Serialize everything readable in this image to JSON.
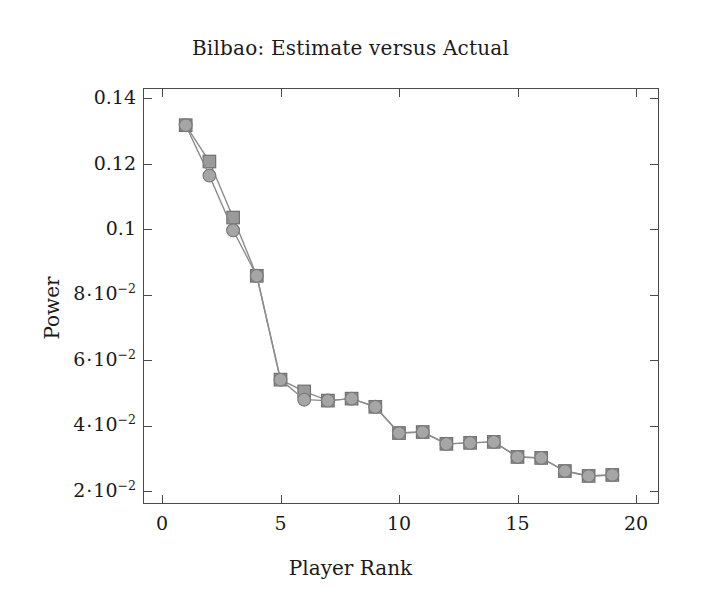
{
  "chart_data": {
    "type": "line",
    "title": "Bilbao: Estimate versus Actual",
    "xlabel": "Player Rank",
    "ylabel": "Power",
    "xlim": [
      0,
      20
    ],
    "ylim": [
      0.018,
      0.142
    ],
    "grid": false,
    "legend": "none",
    "x": [
      1,
      2,
      3,
      4,
      5,
      6,
      7,
      8,
      9,
      10,
      11,
      12,
      13,
      14,
      15,
      16,
      17,
      18,
      19
    ],
    "xticks": [
      "0",
      "5",
      "10",
      "15",
      "20"
    ],
    "xtick_values": [
      0,
      5,
      10,
      15,
      20
    ],
    "ytick_values": [
      0.14,
      0.12,
      0.1,
      0.08,
      0.06,
      0.04,
      0.02
    ],
    "yticks": [
      {
        "mantissa": "0.14",
        "exponent": ""
      },
      {
        "mantissa": "0.12",
        "exponent": ""
      },
      {
        "mantissa": "0.1",
        "exponent": ""
      },
      {
        "mantissa": "8",
        "exponent": "-2"
      },
      {
        "mantissa": "6",
        "exponent": "-2"
      },
      {
        "mantissa": "4",
        "exponent": "-2"
      },
      {
        "mantissa": "2",
        "exponent": "-2"
      }
    ],
    "series": [
      {
        "name": "Actual",
        "marker": "square",
        "color": "#9a9a9a",
        "edge_color": "#6f6f6f",
        "line_color": "#8c8c8c",
        "values": [
          0.1317,
          0.1206,
          0.1035,
          0.0857,
          0.054,
          0.0504,
          0.0476,
          0.0482,
          0.0457,
          0.0377,
          0.038,
          0.0344,
          0.0347,
          0.035,
          0.0304,
          0.0301,
          0.0261,
          0.0246,
          0.0249
        ]
      },
      {
        "name": "Estimate",
        "marker": "circle",
        "color": "#a6a6a6",
        "edge_color": "#7a7a7a",
        "line_color": "#8c8c8c",
        "values": [
          0.1317,
          0.1163,
          0.0996,
          0.0857,
          0.054,
          0.0479,
          0.0476,
          0.0482,
          0.0457,
          0.0377,
          0.038,
          0.0344,
          0.0347,
          0.035,
          0.0304,
          0.0301,
          0.0261,
          0.0246,
          0.0249
        ]
      }
    ]
  }
}
